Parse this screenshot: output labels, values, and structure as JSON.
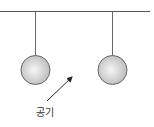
{
  "diagram": {
    "title": "",
    "objects": [
      {
        "name": "support-bar"
      },
      {
        "name": "left-ball",
        "type": "hanging-sphere"
      },
      {
        "name": "right-ball",
        "type": "hanging-sphere"
      }
    ],
    "arrow_label": "공기",
    "colors": {
      "line": "#555555",
      "ball_edge": "#666666",
      "ball_light": "#f4f4f4",
      "ball_dark": "#bdbdbd"
    }
  }
}
